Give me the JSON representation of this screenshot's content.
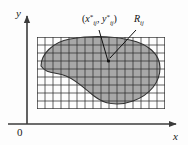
{
  "figure": {
    "title_alt": "Riemann sum grid over a plane region",
    "axes": {
      "x_label": "x",
      "y_label": "y",
      "origin_label": "0",
      "axis_color": "#3b3b3b"
    },
    "annotations": [
      {
        "name": "sample-point-label",
        "text": "(x*ij, y*ij)",
        "paren_open": "(",
        "x_var": "x",
        "star": "*",
        "sub": "ij",
        "comma": ", ",
        "y_var": "y",
        "paren_close": ")"
      },
      {
        "name": "subrectangle-label",
        "text": "Rij",
        "r_var": "R",
        "sub": "ij"
      }
    ],
    "grid": {
      "left": 37,
      "top": 37,
      "right": 165,
      "bottom": 109,
      "cols": 16,
      "rows": 9,
      "line_color": "#2e2e2e",
      "cell_fill": "#ffffff"
    },
    "region": {
      "name": "shaded-region",
      "fill_color": "#a8a8a8",
      "stroke_color": "#333333"
    }
  }
}
